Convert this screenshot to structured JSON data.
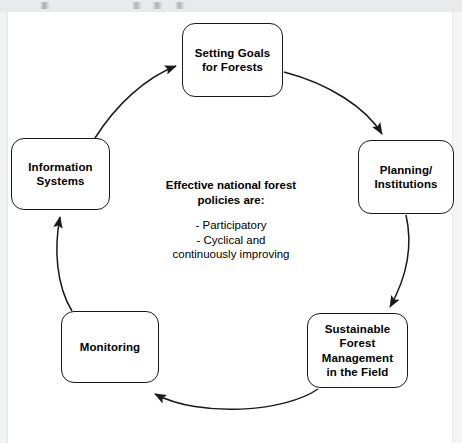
{
  "diagram": {
    "title_text": "",
    "colors": {
      "background": "#ffffff",
      "stroke": "#1a1a1a",
      "text": "#000000",
      "edge_band": "#e9eaec"
    },
    "nodes": [
      {
        "id": "goals",
        "label": "Setting Goals\nfor Forests"
      },
      {
        "id": "planning",
        "label": "Planning/\nInstitutions"
      },
      {
        "id": "sustainable",
        "label": "Sustainable\nForest\nManagement\nin the Field"
      },
      {
        "id": "monitoring",
        "label": "Monitoring"
      },
      {
        "id": "information",
        "label": "Information\nSystems"
      }
    ],
    "center": {
      "heading": "Effective national forest\npolicies are:",
      "bullets": "- Participatory\n- Cyclical and\ncontinuously improving"
    },
    "arrows": [
      {
        "id": "goals-to-planning",
        "from": "goals",
        "to": "planning"
      },
      {
        "id": "planning-to-sustainable",
        "from": "planning",
        "to": "sustainable"
      },
      {
        "id": "sustainable-to-monitoring",
        "from": "sustainable",
        "to": "monitoring"
      },
      {
        "id": "monitoring-to-information",
        "from": "monitoring",
        "to": "information"
      },
      {
        "id": "information-to-goals",
        "from": "information",
        "to": "goals"
      }
    ]
  }
}
